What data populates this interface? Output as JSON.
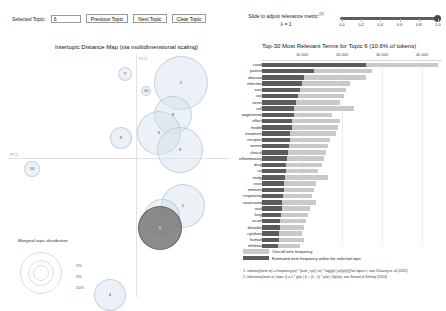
{
  "toolbar": {
    "selected_topic_label": "Selected Topic:",
    "selected_topic_value": "6",
    "previous_topic_label": "Previous Topic",
    "next_topic_label": "Next Topic",
    "clear_topic_label": "Clear Topic"
  },
  "lambda_slider": {
    "caption": "Slide to adjust relevance metric:",
    "caption_sup": "(2)",
    "value_label": "λ = 1",
    "value": 1.0,
    "ticks": [
      "0.0",
      "0.2",
      "0.4",
      "0.6",
      "0.8",
      "1.0"
    ],
    "handle_color": "#4a4a4a",
    "track_color": "#5e5e5e"
  },
  "left_panel": {
    "title": "Intertopic Distance Map (via multidimensional scaling)",
    "x_axis_label": "PC1",
    "y_axis_label": "PC2",
    "marginal_legend": {
      "title": "Marginal topic distribution",
      "sizes": [
        "2%",
        "5%",
        "10%"
      ]
    },
    "bubble_fill": "#d2e1eb",
    "bubble_selected_fill": "#787878",
    "topics": [
      {
        "id": "2",
        "cx": 173,
        "cy": 29,
        "r": 27,
        "selected": false
      },
      {
        "id": "8",
        "cx": 165,
        "cy": 61,
        "r": 19,
        "selected": false
      },
      {
        "id": "5",
        "cx": 151,
        "cy": 79,
        "r": 22,
        "selected": false
      },
      {
        "id": "3",
        "cx": 172,
        "cy": 96,
        "r": 23,
        "selected": false
      },
      {
        "id": "9",
        "cx": 113,
        "cy": 84,
        "r": 11,
        "selected": false
      },
      {
        "id": "7",
        "cx": 117,
        "cy": 20,
        "r": 7,
        "selected": false
      },
      {
        "id": "10",
        "cx": 138,
        "cy": 37,
        "r": 5,
        "selected": false
      },
      {
        "id": "10",
        "cx": 24,
        "cy": 115,
        "r": 8,
        "selected": false
      },
      {
        "id": "1",
        "cx": 175,
        "cy": 152,
        "r": 22,
        "selected": false
      },
      {
        "id": "7",
        "cx": 154,
        "cy": 163,
        "r": 18,
        "selected": false
      },
      {
        "id": "6",
        "cx": 152,
        "cy": 174,
        "r": 22,
        "selected": true
      },
      {
        "id": "4",
        "cx": 102,
        "cy": 241,
        "r": 16,
        "selected": false
      }
    ]
  },
  "right_panel": {
    "title": "Top-30 Most Relevant Terms for Topic 6 (10.6% of tokens)",
    "legend": {
      "overall": "Overall term frequency",
      "topic": "Estimated term frequency within the selected topic"
    },
    "footnotes": [
      "1. saliency(term w) = frequency(w) * [sum_t p(t | w) * log(p(t | w)/p(t))] for topics t; see Chuang et. al (2012)",
      "2. relevance(term w | topic t) = λ * p(w | t) + (1 - λ) * p(w | t)/p(w); see Sievert & Shirley (2014)"
    ],
    "color_overall": "#c9c9c9",
    "color_topic": "#5c5c5c"
  },
  "chart_data": {
    "type": "bar",
    "title": "Top-30 Most Relevant Terms for Topic 6 (10.6% of tokens)",
    "xlabel": "",
    "ylabel": "",
    "xlim": [
      0,
      45000
    ],
    "xticks": [
      10000,
      20000,
      30000,
      40000
    ],
    "xtick_labels": [
      "10,000",
      "20,000",
      "30,000",
      "40,000"
    ],
    "grid": true,
    "orientation": "horizontal",
    "legend_position": "bottom",
    "categories": [
      "covid",
      "patient",
      "disease",
      "infection",
      "sars",
      "cov",
      "sever",
      "cell",
      "angiotensin",
      "effect",
      "model",
      "treatment",
      "receptor",
      "severe",
      "clinical",
      "inflammatory",
      "drug",
      "rat",
      "study",
      "virus",
      "immune",
      "respiratory",
      "associated",
      "viral",
      "lung",
      "acute",
      "disorder",
      "cytokine",
      "human",
      "inhibitor"
    ],
    "series": [
      {
        "name": "Overall term frequency",
        "color": "#c9c9c9",
        "values": [
          44000,
          27500,
          26000,
          22000,
          21000,
          20500,
          19500,
          23000,
          17500,
          19500,
          19000,
          18500,
          17000,
          16500,
          16000,
          15500,
          15000,
          14000,
          16500,
          13500,
          13000,
          12500,
          13500,
          12000,
          11500,
          11000,
          10500,
          10000,
          10500,
          9500
        ]
      },
      {
        "name": "Estimated term frequency within the selected topic",
        "color": "#5c5c5c",
        "values": [
          26000,
          13000,
          10500,
          10000,
          9500,
          9000,
          8500,
          8000,
          8000,
          7500,
          7500,
          7000,
          7000,
          6800,
          6500,
          6300,
          6000,
          6000,
          5800,
          5600,
          5500,
          5200,
          5000,
          5000,
          4800,
          4600,
          4500,
          4300,
          4200,
          4000
        ]
      }
    ]
  }
}
